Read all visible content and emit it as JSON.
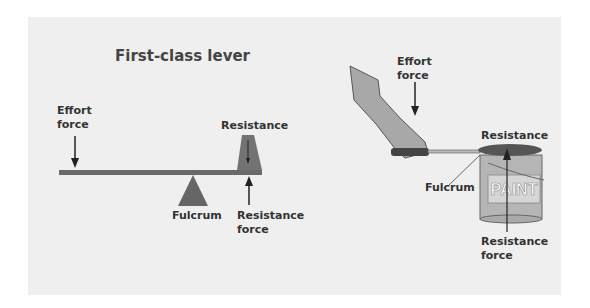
{
  "left_diagram": {
    "title": "First-class lever",
    "effort_label_1": "Effort",
    "effort_label_2": "force",
    "resistance_label": "Resistance",
    "fulcrum_label": "Fulcrum",
    "resistance_force_label_1": "Resistance",
    "resistance_force_label_2": "force"
  },
  "right_diagram": {
    "effort_label_1": "Effort",
    "effort_label_2": "force",
    "resistance_label": "Resistance",
    "fulcrum_label": "Fulcrum",
    "resistance_force_label_1": "Resistance",
    "resistance_force_label_2": "force",
    "can_text": "PAINT"
  }
}
